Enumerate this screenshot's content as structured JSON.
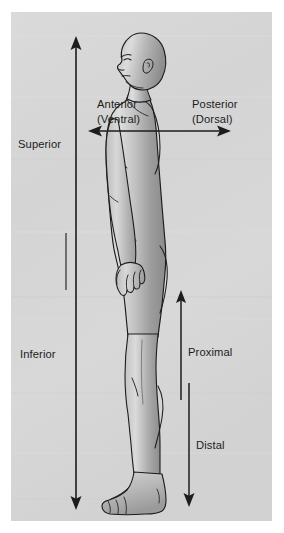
{
  "figure": {
    "panel_color": "#d6d6d6",
    "background_color": "#ffffff",
    "line_color": "#1c1c1c",
    "body_fill_light": "#dcdcdc",
    "body_fill_mid": "#a8a8a8",
    "body_fill_dark": "#8c8c8c"
  },
  "labels": {
    "superior": "Superior",
    "inferior": "Inferior",
    "anterior": "Anterior",
    "anterior_alt": "(Ventral)",
    "posterior": "Posterior",
    "posterior_alt": "(Dorsal)",
    "proximal": "Proximal",
    "distal": "Distal"
  },
  "arrows": [
    {
      "name": "superior-inferior-axis",
      "orientation": "vertical",
      "direction": "both",
      "x": 76,
      "y_start": 38,
      "y_end": 508,
      "labels": [
        "Superior",
        "Inferior"
      ]
    },
    {
      "name": "anterior-posterior-axis",
      "orientation": "horizontal",
      "direction": "both",
      "y": 131,
      "x_start": 90,
      "x_end": 229,
      "labels": [
        "Anterior (Ventral)",
        "Posterior (Dorsal)"
      ]
    },
    {
      "name": "proximal-axis",
      "orientation": "vertical",
      "direction": "up",
      "x": 181,
      "y_start": 400,
      "y_end": 292,
      "labels": [
        "Proximal"
      ]
    },
    {
      "name": "distal-axis",
      "orientation": "vertical",
      "direction": "down",
      "x": 189,
      "y_start": 383,
      "y_end": 506,
      "labels": [
        "Distal"
      ]
    }
  ],
  "label_positions": {
    "superior": {
      "x": 18,
      "y": 144,
      "anchor": "start"
    },
    "inferior": {
      "x": 20,
      "y": 354,
      "anchor": "start"
    },
    "anterior": {
      "x": 98,
      "y": 105,
      "anchor": "start"
    },
    "anterior_alt": {
      "x": 98,
      "y": 120,
      "anchor": "start"
    },
    "posterior": {
      "x": 193,
      "y": 105,
      "anchor": "start"
    },
    "posterior_alt": {
      "x": 193,
      "y": 120,
      "anchor": "start"
    },
    "proximal": {
      "x": 188,
      "y": 352,
      "anchor": "start"
    },
    "distal": {
      "x": 196,
      "y": 446,
      "anchor": "start"
    }
  }
}
